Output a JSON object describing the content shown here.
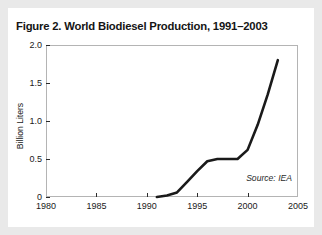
{
  "figure": {
    "title": "Figure 2. World Biodiesel Production, 1991–2003",
    "source_note": "Source: IEA"
  },
  "chart_data": {
    "type": "line",
    "title": "Figure 2. World Biodiesel Production, 1991–2003",
    "xlabel": "",
    "ylabel": "Billion Liters",
    "xlim": [
      1980,
      2005
    ],
    "ylim": [
      0,
      2.0
    ],
    "grid": false,
    "legend": null,
    "xticks": [
      1980,
      1985,
      1990,
      1995,
      2000,
      2005
    ],
    "xtick_labels": [
      "1980",
      "1985",
      "1990",
      "1995",
      "2000",
      "2005"
    ],
    "yticks": [
      0,
      0.5,
      1.0,
      1.5,
      2.0
    ],
    "ytick_labels": [
      "0",
      "0.5",
      "1.0",
      "1.5",
      "2.0"
    ],
    "annotations": [
      "Source: IEA"
    ],
    "line_color": "#1a1a1a",
    "series": [
      {
        "name": "World biodiesel production",
        "x": [
          1991,
          1992,
          1993,
          1994,
          1995,
          1996,
          1997,
          1998,
          1999,
          2000,
          2001,
          2002,
          2003
        ],
        "values": [
          0.0,
          0.02,
          0.06,
          0.2,
          0.34,
          0.47,
          0.5,
          0.5,
          0.5,
          0.62,
          0.95,
          1.35,
          1.8
        ]
      }
    ]
  }
}
